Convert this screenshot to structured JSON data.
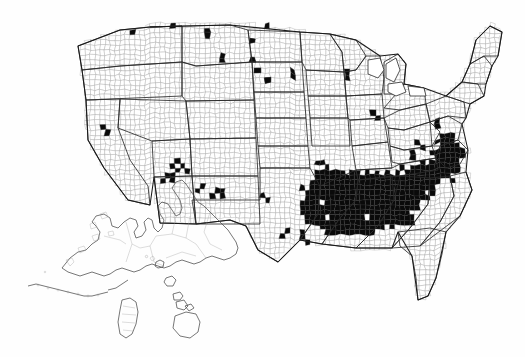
{
  "figure": {
    "kind": "map",
    "title": "",
    "subtitle": "",
    "caption": "",
    "region_label": "United States"
  },
  "legend": {
    "visible": false,
    "present_label": "",
    "absent_label": "",
    "items": []
  },
  "colors": {
    "background": "#fefefe",
    "county_fill_absent": "#ffffff",
    "county_fill_present": "#0a0a0a",
    "county_border": "#8e8e8e",
    "state_border": "#2a2a2a",
    "nation_border": "#1a1a1a",
    "inset_border": "#4a4a4a"
  },
  "chart_data": {
    "type": "heatmap",
    "title": "",
    "xlabel": "",
    "ylabel": "",
    "scale": "binary",
    "unit_label": "county",
    "categories": [
      "absent",
      "present"
    ],
    "values": [
      0,
      1
    ],
    "projection": "albers-usa",
    "insets": [
      "Alaska",
      "Hawaii"
    ],
    "regions": [
      {
        "name": "Deep South core",
        "states": [
          "Mississippi",
          "Alabama",
          "Louisiana",
          "Georgia",
          "South Carolina"
        ],
        "density": "very high",
        "values": 1
      },
      {
        "name": "Atlantic coastal plain",
        "states": [
          "North Carolina",
          "Virginia",
          "Maryland"
        ],
        "density": "high",
        "values": 1
      },
      {
        "name": "Arkansas / Tennessee delta",
        "states": [
          "Arkansas",
          "Tennessee"
        ],
        "density": "high",
        "values": 1
      },
      {
        "name": "East Texas",
        "states": [
          "Texas"
        ],
        "density": "low",
        "values": 1
      },
      {
        "name": "North Florida",
        "states": [
          "Florida"
        ],
        "density": "moderate",
        "values": 1
      },
      {
        "name": "Scattered West",
        "states": [
          "Washington",
          "Idaho",
          "Montana",
          "North Dakota",
          "Nevada",
          "Utah",
          "Arizona",
          "New Mexico"
        ],
        "density": "sparse",
        "values": 1
      },
      {
        "name": "Great Lakes scatter",
        "states": [
          "Michigan",
          "Wisconsin",
          "Minnesota"
        ],
        "density": "sparse",
        "values": 1
      },
      {
        "name": "Plains / Corn Belt",
        "states": [
          "Iowa",
          "Nebraska",
          "Kansas",
          "Missouri"
        ],
        "density": "near zero",
        "values": 0
      },
      {
        "name": "Northeast",
        "states": [
          "Maine",
          "New York",
          "Pennsylvania"
        ],
        "density": "near zero",
        "values": 0
      },
      {
        "name": "Alaska",
        "states": [
          "Alaska"
        ],
        "density": "none",
        "values": 0
      },
      {
        "name": "Hawaii",
        "states": [
          "Hawaii"
        ],
        "density": "none",
        "values": 0
      }
    ]
  }
}
